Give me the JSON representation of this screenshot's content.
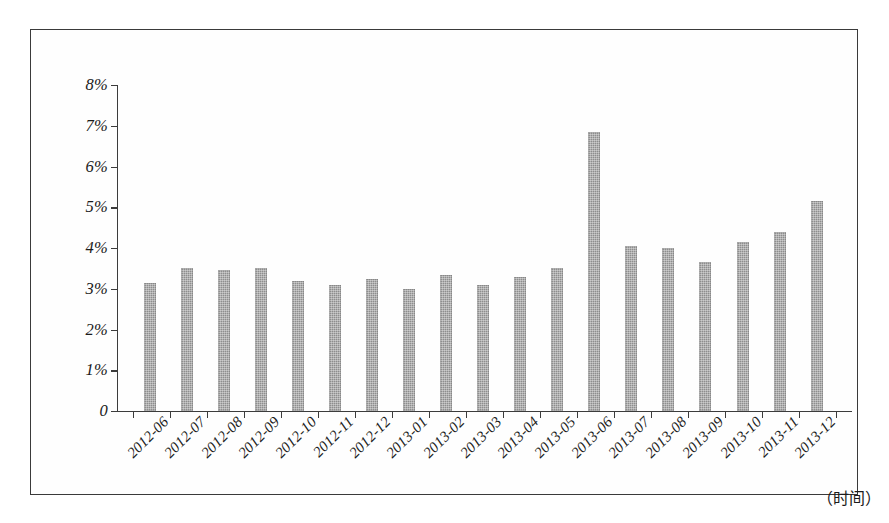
{
  "chart_data": {
    "type": "bar",
    "title": "",
    "subtitle": "",
    "xlabel": "（时间）",
    "ylabel": "",
    "grid": false,
    "legend": null,
    "legend_position": "none",
    "ylim": [
      0,
      8
    ],
    "ytick_labels": [
      "0",
      "1%",
      "2%",
      "3%",
      "4%",
      "5%",
      "6%",
      "7%",
      "8%"
    ],
    "ytick_values": [
      0,
      1,
      2,
      3,
      4,
      5,
      6,
      7,
      8
    ],
    "value_unit": "%",
    "categories": [
      "2012-06",
      "2012-07",
      "2012-08",
      "2012-09",
      "2012-10",
      "2012-11",
      "2012-12",
      "2013-01",
      "2013-02",
      "2013-03",
      "2013-04",
      "2013-05",
      "2013-06",
      "2013-07",
      "2013-08",
      "2013-09",
      "2013-10",
      "2013-11",
      "2013-12"
    ],
    "values": [
      3.15,
      3.5,
      3.45,
      3.5,
      3.2,
      3.1,
      3.25,
      3.0,
      3.35,
      3.1,
      3.3,
      3.5,
      6.85,
      4.05,
      4.0,
      3.65,
      4.15,
      4.4,
      5.15
    ],
    "series": [
      {
        "name": "",
        "values": [
          3.15,
          3.5,
          3.45,
          3.5,
          3.2,
          3.1,
          3.25,
          3.0,
          3.35,
          3.1,
          3.3,
          3.5,
          6.85,
          4.05,
          4.0,
          3.65,
          4.15,
          4.4,
          5.15
        ]
      }
    ],
    "bar_color": "#8e8e8e",
    "axis_color": "#3c3c3c",
    "background_color": "#ffffff"
  }
}
